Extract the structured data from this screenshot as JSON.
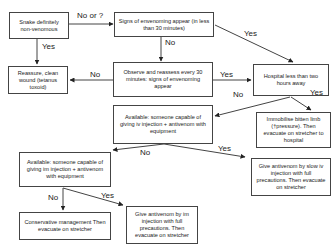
{
  "nodes": {
    "snake_nonvenomous": "Snake definitely non-venomous",
    "signs_envenoming": "Signs of envenoming appear (in less than 30 minutes)",
    "reassure": "Reassure, clean wound (tetanus toxoid)",
    "observe": "Observe and reassess every 30 minutes: signs of envenoming appear",
    "hospital_near": "Hospital less than two hours away",
    "available_iv": "Available: someone capable of giving iv injection + antivenom with equipment",
    "immobilise": "Immobilise bitten limb (†pressure). Then evacuate on stretcher to hospital",
    "available_im": "Available: someone capable of giving im injection + antivenom with equipment",
    "give_iv": "Give antivenom by slow iv injection with full precautions. Then evacuate on stretcher",
    "conservative": "Conservative management Then evacuate on stretcher",
    "give_im": "Give antivenom by im injection with full precautions. Then evacuate on stretcher"
  },
  "edge_labels": {
    "no_or_q": "No or ?",
    "yes_reassure": "Yes",
    "no_observe": "No",
    "yes_hospital_1": "Yes",
    "no_reassure": "No",
    "yes_hospital_2": "Yes",
    "no_available_iv": "No",
    "yes_immobilise": "Yes",
    "no_available_im": "No",
    "yes_give_iv": "Yes",
    "no_conservative": "No",
    "yes_give_im": "Yes"
  }
}
